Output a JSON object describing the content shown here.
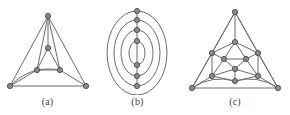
{
  "figure": {
    "background_color": "#ffffff",
    "edge_color": "#6b6b6b",
    "vertex_fill_color": "#8c8c8c",
    "vertex_stroke_color": "#4a4a4a",
    "caption_color": "#3a3a3a",
    "width": 290,
    "height": 115,
    "panels": [
      {
        "id": "a",
        "caption": "(a)",
        "description": "planar graph drawn as nested triangles",
        "vertex_count": 6,
        "edge_count": 12,
        "vertices": [
          {
            "name": "outer-top",
            "x": 48,
            "y": 16
          },
          {
            "name": "outer-bottom-left",
            "x": 10,
            "y": 86
          },
          {
            "name": "outer-bottom-right",
            "x": 86,
            "y": 86
          },
          {
            "name": "inner-top",
            "x": 48,
            "y": 48
          },
          {
            "name": "inner-bottom-left",
            "x": 37,
            "y": 70
          },
          {
            "name": "inner-bottom-right",
            "x": 60,
            "y": 70
          }
        ],
        "edges": [
          [
            0,
            1
          ],
          [
            0,
            2
          ],
          [
            1,
            2
          ],
          [
            3,
            4
          ],
          [
            4,
            5
          ],
          [
            5,
            3
          ],
          [
            0,
            3
          ],
          [
            1,
            4
          ],
          [
            2,
            5
          ],
          [
            0,
            4
          ],
          [
            0,
            5
          ],
          [
            1,
            5
          ]
        ],
        "curved_edges": [
          {
            "from": 1,
            "to": 5,
            "bow": -7
          }
        ]
      },
      {
        "id": "b",
        "caption": "(b)",
        "description": "graph drawn with four concentric ellipses and seven collinear vertices",
        "vertex_count": 7,
        "ellipse_count": 4,
        "center_x": 42,
        "center_y": 53,
        "ellipses": [
          {
            "rx": 8,
            "ry": 12
          },
          {
            "rx": 16,
            "ry": 23
          },
          {
            "rx": 23,
            "ry": 33
          },
          {
            "rx": 30,
            "ry": 42
          }
        ],
        "vertices": [
          {
            "name": "node-1",
            "x": 42,
            "y": 11
          },
          {
            "name": "node-2",
            "x": 42,
            "y": 20
          },
          {
            "name": "node-3",
            "x": 42,
            "y": 30
          },
          {
            "name": "node-4",
            "x": 42,
            "y": 41
          },
          {
            "name": "node-5",
            "x": 42,
            "y": 65
          },
          {
            "name": "node-6",
            "x": 42,
            "y": 76
          },
          {
            "name": "node-7",
            "x": 42,
            "y": 86
          }
        ],
        "axis_line": {
          "x": 42,
          "y1": 11,
          "y2": 86
        }
      },
      {
        "id": "c",
        "caption": "(c)",
        "description": "icosahedron-like planar graph with outer triangle and nested inner structure",
        "vertex_count": 12,
        "vertices": [
          {
            "name": "apex",
            "x": 55,
            "y": 12
          },
          {
            "name": "bottom-left",
            "x": 12,
            "y": 88
          },
          {
            "name": "bottom-right",
            "x": 98,
            "y": 88
          },
          {
            "name": "upper-mid",
            "x": 55,
            "y": 42
          },
          {
            "name": "ring-left",
            "x": 32,
            "y": 53
          },
          {
            "name": "ring-right",
            "x": 78,
            "y": 53
          },
          {
            "name": "core-left",
            "x": 44,
            "y": 59
          },
          {
            "name": "core-right",
            "x": 66,
            "y": 59
          },
          {
            "name": "core-bottom",
            "x": 55,
            "y": 69
          },
          {
            "name": "low-left",
            "x": 32,
            "y": 76
          },
          {
            "name": "low-right",
            "x": 78,
            "y": 76
          },
          {
            "name": "bottom-mid",
            "x": 55,
            "y": 81
          }
        ],
        "edges": [
          [
            0,
            1
          ],
          [
            0,
            2
          ],
          [
            1,
            2
          ],
          [
            0,
            3
          ],
          [
            0,
            4
          ],
          [
            0,
            5
          ],
          [
            1,
            4
          ],
          [
            1,
            9
          ],
          [
            1,
            11
          ],
          [
            2,
            5
          ],
          [
            2,
            10
          ],
          [
            2,
            11
          ],
          [
            3,
            4
          ],
          [
            3,
            5
          ],
          [
            3,
            6
          ],
          [
            3,
            7
          ],
          [
            4,
            6
          ],
          [
            4,
            9
          ],
          [
            5,
            7
          ],
          [
            5,
            10
          ],
          [
            6,
            7
          ],
          [
            6,
            8
          ],
          [
            6,
            9
          ],
          [
            7,
            8
          ],
          [
            7,
            10
          ],
          [
            8,
            9
          ],
          [
            8,
            10
          ],
          [
            8,
            11
          ],
          [
            9,
            11
          ],
          [
            10,
            11
          ]
        ],
        "curved_edges": [
          {
            "from": 1,
            "to": 11,
            "bow": -5
          },
          {
            "from": 2,
            "to": 11,
            "bow": 5
          }
        ]
      }
    ]
  }
}
